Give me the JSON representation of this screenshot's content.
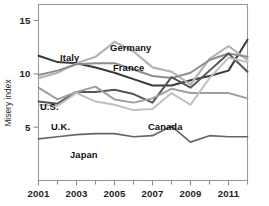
{
  "chart_data": {
    "type": "line",
    "title": "",
    "xlabel": "",
    "ylabel": "Misery index",
    "xlim": [
      2001,
      2012
    ],
    "ylim": [
      0,
      16.5
    ],
    "grid": false,
    "legend_position": "inline-labels",
    "x": [
      2001,
      2002,
      2003,
      2004,
      2005,
      2006,
      2007,
      2008,
      2009,
      2010,
      2011,
      2012
    ],
    "xticks_major": [
      2001,
      2003,
      2005,
      2007,
      2009,
      2011
    ],
    "xticks_minor": [
      2002,
      2004,
      2006,
      2008,
      2010,
      2012
    ],
    "xtick_labels": [
      "2001",
      "2003",
      "2005",
      "2007",
      "2009",
      "2011"
    ],
    "yticks": [
      5,
      10,
      15
    ],
    "ytick_labels": [
      "5",
      "10",
      "15"
    ],
    "series": [
      {
        "name": "Italy",
        "color": "#3a3a3a",
        "width": 2.0,
        "values": [
          11.7,
          11.1,
          11.0,
          10.6,
          10.1,
          9.5,
          8.9,
          8.9,
          9.4,
          9.8,
          10.3,
          13.2
        ]
      },
      {
        "name": "Germany",
        "color": "#b4b4b4",
        "width": 2.2,
        "values": [
          9.6,
          10.1,
          11.0,
          11.6,
          13.0,
          12.1,
          10.6,
          10.2,
          9.0,
          11.4,
          12.6,
          11.3
        ]
      },
      {
        "name": "France",
        "color": "#8d8d8d",
        "width": 2.0,
        "values": [
          9.9,
          10.3,
          10.9,
          11.0,
          11.0,
          10.4,
          9.8,
          9.6,
          10.1,
          11.3,
          11.9,
          11.6
        ]
      },
      {
        "name": "U.S.",
        "color": "#555555",
        "width": 2.0,
        "values": [
          7.4,
          7.2,
          8.3,
          8.3,
          8.5,
          8.1,
          7.3,
          9.7,
          8.7,
          10.3,
          11.9,
          10.2
        ]
      },
      {
        "name": "U.K.",
        "color": "#9f9f9f",
        "width": 2.0,
        "values": [
          8.7,
          7.6,
          8.3,
          8.8,
          7.6,
          7.3,
          7.7,
          8.6,
          8.2,
          8.2,
          8.2,
          7.7
        ]
      },
      {
        "name": "Canada",
        "color": "#c0c0c0",
        "width": 2.0,
        "values": [
          7.1,
          7.0,
          8.2,
          7.4,
          7.1,
          6.6,
          6.7,
          8.2,
          7.1,
          9.6,
          11.5,
          11.1
        ]
      },
      {
        "name": "Japan",
        "color": "#666666",
        "width": 1.7,
        "values": [
          3.9,
          4.1,
          4.3,
          4.4,
          4.4,
          4.1,
          4.2,
          5.1,
          3.6,
          4.2,
          4.1,
          4.1
        ]
      }
    ],
    "annotations": [
      {
        "text": "Italy",
        "x_px": 60,
        "y_px": 61
      },
      {
        "text": "Germany",
        "x_px": 110,
        "y_px": 51
      },
      {
        "text": "France",
        "x_px": 113,
        "y_px": 71
      },
      {
        "text": "U.S.",
        "x_px": 40,
        "y_px": 110
      },
      {
        "text": "U.K.",
        "x_px": 51,
        "y_px": 130
      },
      {
        "text": "Canada",
        "x_px": 148,
        "y_px": 130
      },
      {
        "text": "Japan",
        "x_px": 70,
        "y_px": 158
      }
    ]
  },
  "colors": {
    "background": "#ffffff",
    "frame": "#9a9a9a",
    "text": "#1d1d1d",
    "axis_title": "#2b2b2b"
  }
}
